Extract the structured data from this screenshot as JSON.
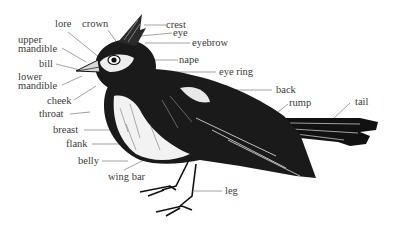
{
  "diagram": {
    "title": "",
    "labels": [
      {
        "id": "lore",
        "text": "lore"
      },
      {
        "id": "crown",
        "text": "crown"
      },
      {
        "id": "crest",
        "text": "crest"
      },
      {
        "id": "eye",
        "text": "eye"
      },
      {
        "id": "eyebrow",
        "text": "eyebrow"
      },
      {
        "id": "upper_mandible_1",
        "text": "upper"
      },
      {
        "id": "upper_mandible_2",
        "text": "mandible"
      },
      {
        "id": "bill",
        "text": "bill"
      },
      {
        "id": "nape",
        "text": "nape"
      },
      {
        "id": "lower_mandible_1",
        "text": "lower"
      },
      {
        "id": "lower_mandible_2",
        "text": "mandible"
      },
      {
        "id": "eye_ring",
        "text": "eye ring"
      },
      {
        "id": "cheek",
        "text": "cheek"
      },
      {
        "id": "throat",
        "text": "throat"
      },
      {
        "id": "back",
        "text": "back"
      },
      {
        "id": "rump",
        "text": "rump"
      },
      {
        "id": "tail",
        "text": "tail"
      },
      {
        "id": "breast",
        "text": "breast"
      },
      {
        "id": "flank",
        "text": "flank"
      },
      {
        "id": "belly",
        "text": "belly"
      },
      {
        "id": "wing_bar",
        "text": "wing bar"
      },
      {
        "id": "leg",
        "text": "leg"
      }
    ]
  }
}
